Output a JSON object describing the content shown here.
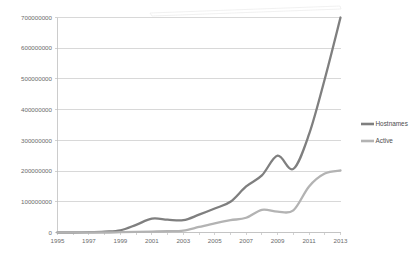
{
  "chart_data": {
    "type": "line",
    "title": "",
    "xlabel": "",
    "ylabel": "",
    "grid": "horizontal",
    "legend_position": "right",
    "x": [
      1995,
      1996,
      1997,
      1998,
      1999,
      2000,
      2001,
      2002,
      2003,
      2004,
      2005,
      2006,
      2007,
      2008,
      2009,
      2010,
      2011,
      2012,
      2013
    ],
    "xlim": [
      1995,
      2013
    ],
    "ylim": [
      0,
      700000000
    ],
    "xticks": [
      "1995",
      "1997",
      "1999",
      "2001",
      "2003",
      "2005",
      "2007",
      "2009",
      "2011",
      "2013"
    ],
    "yticks": [
      "0",
      "100000000",
      "200000000",
      "300000000",
      "400000000",
      "500000000",
      "600000000",
      "700000000"
    ],
    "series": [
      {
        "name": "Hostnames",
        "color": "#7f7f7f",
        "values": [
          0,
          0,
          1000000,
          3000000,
          7000000,
          25000000,
          45000000,
          42000000,
          40000000,
          58000000,
          78000000,
          100000000,
          150000000,
          186000000,
          250000000,
          207000000,
          320000000,
          500000000,
          700000000
        ]
      },
      {
        "name": "Active",
        "color": "#b3b3b3",
        "values": [
          0,
          0,
          0,
          0,
          1000000,
          2000000,
          3000000,
          4000000,
          6000000,
          18000000,
          30000000,
          40000000,
          48000000,
          74000000,
          68000000,
          72000000,
          150000000,
          192000000,
          202000000
        ]
      }
    ]
  },
  "legend": {
    "entries": [
      {
        "label": "Hostnames",
        "color": "#7f7f7f"
      },
      {
        "label": "Active",
        "color": "#b3b3b3"
      }
    ]
  }
}
